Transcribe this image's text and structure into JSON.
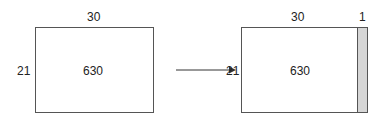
{
  "left": {
    "width_label": "30",
    "height_label": "21",
    "area_label": "630"
  },
  "right": {
    "width_label": "30",
    "extra_width_label": "1",
    "height_label": "21",
    "area_label": "630"
  },
  "colors": {
    "stroke": "#555555",
    "strip_fill": "#d6d6d6"
  }
}
